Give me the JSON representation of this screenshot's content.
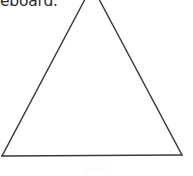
{
  "page": {
    "background_color": "#ffffff",
    "width": 193,
    "height": 176,
    "kind": "scanned-document-fragment"
  },
  "text": {
    "fragment": "eboard.",
    "note": "clipped at top edge of crop",
    "color": "#2b2b2b"
  },
  "figure": {
    "name": "triangle",
    "shape": "triangle",
    "stroke_color": "#3a3a3a",
    "fill": "none",
    "stroke_width": 1.4,
    "apex_clipped_by_top_edge": true,
    "vertices": {
      "apex": [
        92,
        -14
      ],
      "bottom_left": [
        2,
        156
      ],
      "bottom_right": [
        182,
        155
      ]
    },
    "edges": [
      {
        "name": "left-edge",
        "from": "apex",
        "to": "bottom_left"
      },
      {
        "name": "right-edge",
        "from": "apex",
        "to": "bottom_right"
      },
      {
        "name": "base-edge",
        "from": "bottom_left",
        "to": "bottom_right"
      }
    ]
  },
  "marks": {
    "scan_smudge_color": "#fcfcfc"
  }
}
